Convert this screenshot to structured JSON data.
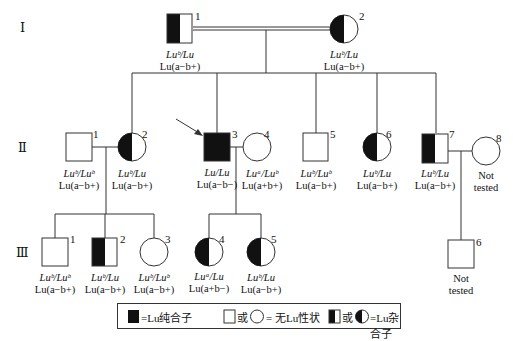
{
  "generations": [
    "Ⅰ",
    "Ⅱ",
    "Ⅲ"
  ],
  "individuals": {
    "I1": {
      "num": "1",
      "sex": "male",
      "status": "heterozygous",
      "genotype": "Luᵇ/Lu",
      "phenotype": "Lu(a−b+)"
    },
    "I2": {
      "num": "2",
      "sex": "female",
      "status": "heterozygous",
      "genotype": "Luᵇ/Lu",
      "phenotype": "Lu(a−b+)"
    },
    "II1": {
      "num": "1",
      "sex": "male",
      "status": "unaffected",
      "genotype": "Luᵇ/Luᵇ",
      "phenotype": "Lu(a−b+)"
    },
    "II2": {
      "num": "2",
      "sex": "female",
      "status": "heterozygous",
      "genotype": "Luᵇ/Lu",
      "phenotype": "Lu(a−b+)"
    },
    "II3": {
      "num": "3",
      "sex": "male",
      "status": "homozygous",
      "proband": true,
      "genotype": "Lu/Lu",
      "phenotype": "Lu(a−b−)"
    },
    "II4": {
      "num": "4",
      "sex": "female",
      "status": "unaffected",
      "genotype": "Luᵃ/Luᵇ",
      "phenotype": "Lu(a+b+)"
    },
    "II5": {
      "num": "5",
      "sex": "male",
      "status": "unaffected",
      "genotype": "Luᵇ/Luᵇ",
      "phenotype": "Lu(a−b+)"
    },
    "II6": {
      "num": "6",
      "sex": "female",
      "status": "heterozygous",
      "genotype": "Luᵇ/Lu",
      "phenotype": "Lu(a−b+)"
    },
    "II7": {
      "num": "7",
      "sex": "male",
      "status": "heterozygous",
      "genotype": "Luᵇ/Lu",
      "phenotype": "Lu(a−b+)"
    },
    "II8": {
      "num": "8",
      "sex": "female",
      "status": "unaffected",
      "line1": "Not",
      "line2": "tested"
    },
    "III1": {
      "num": "1",
      "sex": "male",
      "status": "unaffected",
      "genotype": "Luᵇ/Luᵇ",
      "phenotype": "Lu(a−b+)"
    },
    "III2": {
      "num": "2",
      "sex": "male",
      "status": "heterozygous",
      "genotype": "Luᵇ/Lu",
      "phenotype": "Lu(a−b+)"
    },
    "III3": {
      "num": "3",
      "sex": "female",
      "status": "unaffected",
      "genotype": "Luᵇ/Luᵇ",
      "phenotype": "Lu(a−b+)"
    },
    "III4": {
      "num": "4",
      "sex": "female",
      "status": "heterozygous",
      "genotype": "Luᵃ/Lu",
      "phenotype": "Lu(a+b−)"
    },
    "III5": {
      "num": "5",
      "sex": "female",
      "status": "heterozygous",
      "genotype": "Luᵇ/Lu",
      "phenotype": "Lu(a−b+)"
    },
    "III6": {
      "num": "6",
      "sex": "male",
      "status": "unaffected",
      "line1": "Not",
      "line2": "tested"
    }
  },
  "legend": {
    "homozygous": "=Lu纯合子",
    "or1": "或",
    "unaffected": "= 无Lu性状",
    "or2": "或",
    "heterozygous": "=Lu杂合子"
  }
}
